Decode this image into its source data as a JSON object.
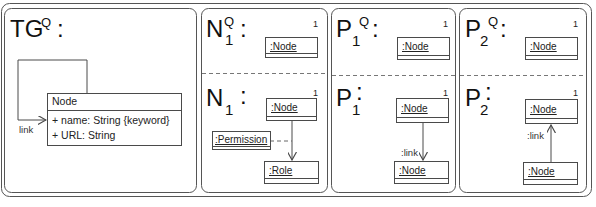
{
  "colors": {
    "line": "#4a4a4a",
    "text": "#222222",
    "background": "#ffffff"
  },
  "panels": {
    "tg": {
      "title_main": "TG",
      "title_sup": "Q",
      "title_colon": ":",
      "class_box": {
        "name": "Node",
        "attributes": [
          "+ name: String {keyword}",
          "+ URL: String"
        ]
      },
      "self_association_label": "link"
    },
    "n": {
      "query": {
        "title_main": "N",
        "title_sup": "Q",
        "title_sub": "1",
        "colon": ":",
        "multiplicity": "1",
        "object": ":Node"
      },
      "pattern": {
        "title_main": "N",
        "title_sub": "1",
        "colon": ":",
        "multiplicity": "1",
        "object_top": ":Node",
        "object_bottom": ":Role",
        "association_class": ":Permission"
      }
    },
    "p1": {
      "query": {
        "title_main": "P",
        "title_sup": "Q",
        "title_sub": "1",
        "colon": ":",
        "multiplicity": "1",
        "object": ":Node"
      },
      "pattern": {
        "title_main": "P",
        "title_sub": "1",
        "colon": ":",
        "multiplicity": "1",
        "object_top": ":Node",
        "object_bottom": ":Node",
        "link_label": ":link"
      }
    },
    "p2": {
      "query": {
        "title_main": "P",
        "title_sup": "Q",
        "title_sub": "2",
        "colon": ":",
        "multiplicity": "1",
        "object": ":Node"
      },
      "pattern": {
        "title_main": "P",
        "title_sub": "2",
        "colon": ":",
        "multiplicity": "1",
        "object_top": ":Node",
        "object_bottom": ":Node",
        "link_label": ":link"
      }
    }
  }
}
